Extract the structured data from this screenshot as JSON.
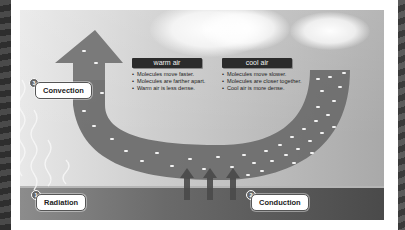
{
  "diagram": {
    "labels": [
      {
        "number": "1",
        "text": "Radiation"
      },
      {
        "number": "2",
        "text": "Conduction"
      },
      {
        "number": "3",
        "text": "Convection"
      }
    ],
    "warm_air": {
      "title": "warm air",
      "points": [
        "Molecules move faster.",
        "Molecules are farther apart.",
        "Warm air is less dense."
      ]
    },
    "cool_air": {
      "title": "cool air",
      "points": [
        "Molecules move slower.",
        "Molecules are closer together.",
        "Cool air is more dense."
      ]
    },
    "icons": {
      "convection_arrow": "up-arrow-icon",
      "conduction_arrows": "up-arrow-icon",
      "radiation_waves": "wavy-line-icon",
      "clouds": "cloud-icon"
    },
    "colors": {
      "band": "#6e6e6e",
      "arrow": "#7a7a7a",
      "ground": "#555555",
      "title_bar": "#2b2b2b",
      "label_bg": "#ffffff"
    }
  }
}
